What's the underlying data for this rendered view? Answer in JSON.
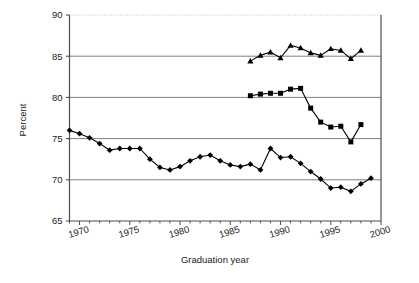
{
  "chart_data": {
    "type": "line",
    "title": "",
    "xlabel": "Graduation year",
    "ylabel": "Percent",
    "xlim": [
      1969,
      2000
    ],
    "ylim": [
      65,
      90
    ],
    "yticks": [
      65,
      70,
      75,
      80,
      85,
      90
    ],
    "xticks": [
      1970,
      1975,
      1980,
      1985,
      1990,
      1995,
      2000
    ],
    "xtick_labels": [
      "1970",
      "1975",
      "1980",
      "1985",
      "1990",
      "1995",
      "2000"
    ],
    "ytick_labels": [
      "65",
      "70",
      "75",
      "80",
      "85",
      "90"
    ],
    "xtick_minor_step": 1,
    "grid": "horizontal",
    "grid_color": "#808080",
    "legend": "none",
    "line_color": "#000000",
    "marker_color": "#000000",
    "series": [
      {
        "name": "triangle-series",
        "marker": "triangle",
        "x": [
          1987,
          1988,
          1989,
          1990,
          1991,
          1992,
          1993,
          1994,
          1995,
          1996,
          1997,
          1998
        ],
        "values": [
          84.4,
          85.1,
          85.5,
          84.8,
          86.3,
          86.0,
          85.4,
          85.1,
          85.9,
          85.7,
          84.7,
          85.7
        ]
      },
      {
        "name": "square-series",
        "marker": "square",
        "x": [
          1987,
          1988,
          1989,
          1990,
          1991,
          1992,
          1993,
          1994,
          1995,
          1996,
          1997,
          1998
        ],
        "values": [
          80.2,
          80.4,
          80.5,
          80.5,
          81.0,
          81.1,
          78.7,
          77.0,
          76.4,
          76.5,
          74.6,
          76.7
        ]
      },
      {
        "name": "diamond-series",
        "marker": "diamond",
        "x": [
          1969,
          1970,
          1971,
          1972,
          1973,
          1974,
          1975,
          1976,
          1977,
          1978,
          1979,
          1980,
          1981,
          1982,
          1983,
          1984,
          1985,
          1986,
          1987,
          1988,
          1989,
          1990,
          1991,
          1992,
          1993,
          1994,
          1995,
          1996,
          1997,
          1998,
          1999
        ],
        "values": [
          76.0,
          75.6,
          75.1,
          74.4,
          73.6,
          73.8,
          73.8,
          73.8,
          72.5,
          71.5,
          71.2,
          71.6,
          72.3,
          72.8,
          73.0,
          72.3,
          71.8,
          71.6,
          71.9,
          71.2,
          73.8,
          72.7,
          72.8,
          72.0,
          71.0,
          70.1,
          69.0,
          69.1,
          68.6,
          69.5,
          70.2
        ]
      }
    ]
  }
}
